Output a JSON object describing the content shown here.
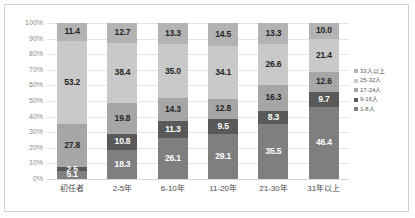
{
  "chart_data": {
    "type": "bar",
    "title": "",
    "subtitle": "",
    "xlabel": "",
    "ylabel": "",
    "stacked": true,
    "stack_mode": "percent",
    "grid": true,
    "legend_position": "right",
    "ylim": [
      0,
      100
    ],
    "yticks": [
      "0%",
      "10%",
      "20%",
      "30%",
      "40%",
      "50%",
      "60%",
      "70%",
      "80%",
      "90%",
      "100%"
    ],
    "ytick_values": [
      0,
      10,
      20,
      30,
      40,
      50,
      60,
      70,
      80,
      90,
      100
    ],
    "categories": [
      "初任者",
      "2-5年",
      "6-10年",
      "11-20年",
      "21-30年",
      "31年以上"
    ],
    "series": [
      {
        "name": "1-8人",
        "color": "#7f7f7f",
        "label_color": "#ffffff",
        "values": [
          5.1,
          18.3,
          26.1,
          29.1,
          35.5,
          46.4
        ]
      },
      {
        "name": "9-16人",
        "color": "#595959",
        "label_color": "#ffffff",
        "values": [
          2.5,
          10.8,
          11.3,
          9.5,
          8.3,
          9.7
        ]
      },
      {
        "name": "17-24人",
        "color": "#a6a6a6",
        "label_color": "#262626",
        "values": [
          27.8,
          19.8,
          14.3,
          12.8,
          16.3,
          12.6
        ]
      },
      {
        "name": "25-32人",
        "color": "#c9c9c9",
        "label_color": "#262626",
        "values": [
          53.2,
          38.4,
          35.0,
          34.1,
          26.6,
          21.4
        ]
      },
      {
        "name": "33人以上",
        "color": "#b3b3b3",
        "label_color": "#262626",
        "values": [
          11.4,
          12.7,
          13.3,
          14.5,
          13.3,
          10.0
        ]
      }
    ],
    "legend_order_top_to_bottom": [
      "33人以上",
      "25-32人",
      "17-24人",
      "9-16人",
      "1-8人"
    ]
  },
  "axis": {
    "y_ticks": [
      "100%",
      "90%",
      "80%",
      "70%",
      "60%",
      "50%",
      "40%",
      "30%",
      "20%",
      "10%",
      "0%"
    ]
  },
  "colors": {
    "frame_border": "#d2d2d2",
    "gridline": "#e4e4e4",
    "background": "#ffffff",
    "tick_text": "#8a8a8a",
    "category_text": "#4a4a4a",
    "legend_text": "#5a5a5a"
  }
}
